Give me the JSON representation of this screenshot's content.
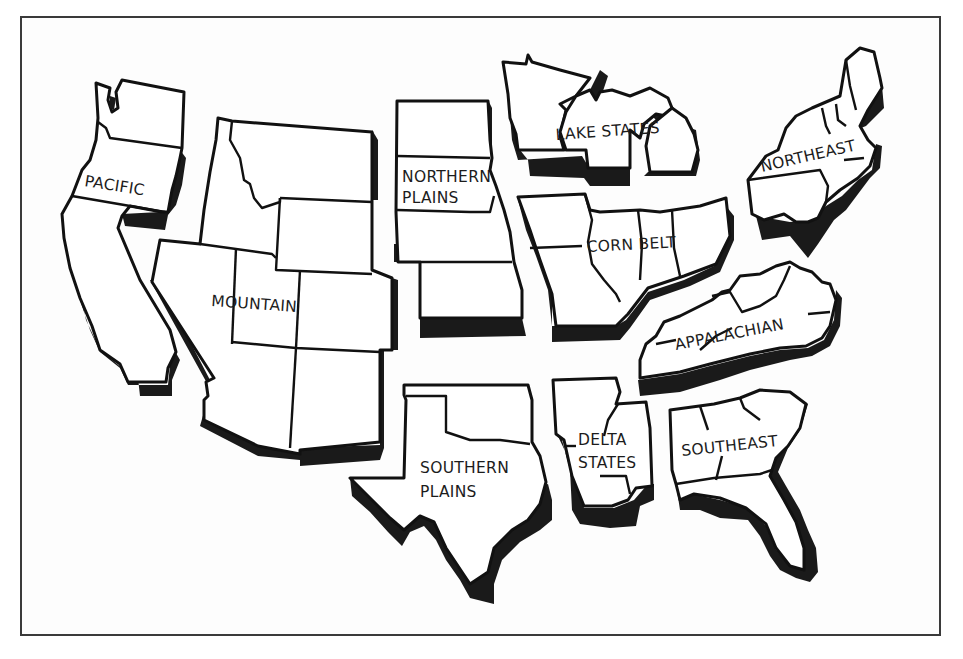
{
  "map": {
    "title": "U.S. Farm Production Regions",
    "colors": {
      "outline": "#111111",
      "shadow": "#1a1a1a",
      "fill": "#ffffff",
      "frame": "#3a3a3a"
    },
    "regions": [
      {
        "id": "pacific",
        "label": "PACIFIC"
      },
      {
        "id": "mountain",
        "label": "MOUNTAIN"
      },
      {
        "id": "northern-plains",
        "label_line1": "NORTHERN",
        "label_line2": "PLAINS"
      },
      {
        "id": "lake-states",
        "label": "LAKE STATES"
      },
      {
        "id": "corn-belt",
        "label": "CORN BELT"
      },
      {
        "id": "northeast",
        "label": "NORTHEAST"
      },
      {
        "id": "appalachian",
        "label": "APPALACHIAN"
      },
      {
        "id": "southern-plains",
        "label_line1": "SOUTHERN",
        "label_line2": "PLAINS"
      },
      {
        "id": "delta-states",
        "label_line1": "DELTA",
        "label_line2": "STATES"
      },
      {
        "id": "southeast",
        "label": "SOUTHEAST"
      }
    ]
  }
}
